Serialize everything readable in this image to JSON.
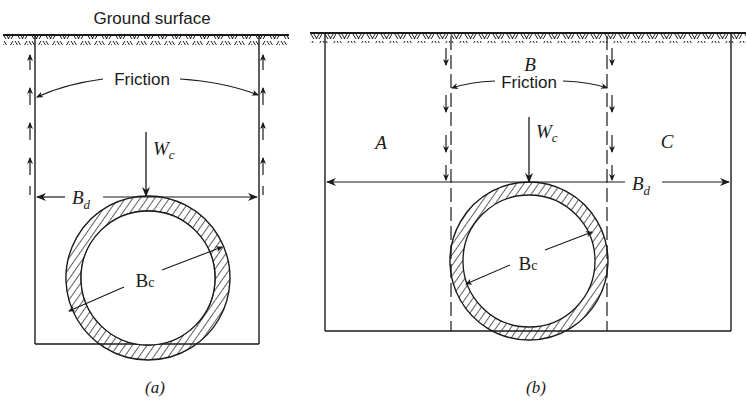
{
  "figure": {
    "ground_label": "Ground surface",
    "ink_color": "#1a1a1a",
    "background": "#ffffff"
  },
  "panel_a": {
    "caption": "(a)",
    "friction_label": "Friction",
    "load_label": "W",
    "load_sub": "c",
    "trench_width_label": "B",
    "trench_width_sub": "d",
    "pipe_diameter_label": "B",
    "pipe_diameter_sub": "c",
    "friction_direction": "upward"
  },
  "panel_b": {
    "caption": "(b)",
    "friction_label": "Friction",
    "prism_labels": [
      "A",
      "B",
      "C"
    ],
    "load_label": "W",
    "load_sub": "c",
    "trench_width_label": "B",
    "trench_width_sub": "d",
    "pipe_diameter_label": "B",
    "pipe_diameter_sub": "c",
    "friction_direction": "downward"
  }
}
